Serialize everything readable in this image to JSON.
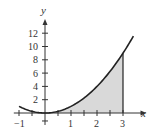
{
  "chart_data": {
    "type": "line",
    "title": "",
    "function": "y = x^2",
    "xlabel": "x",
    "ylabel": "y",
    "xlim": [
      -1.2,
      3.8
    ],
    "ylim": [
      -2,
      14
    ],
    "x_ticks": [
      -1,
      1,
      2,
      3
    ],
    "x_minor_ticks": [
      -0.5,
      0.5,
      1.5,
      2.5
    ],
    "y_ticks": [
      2,
      4,
      6,
      8,
      10,
      12
    ],
    "x": [
      -1,
      -0.5,
      0,
      0.5,
      1,
      1.5,
      2,
      2.5,
      3,
      3.4
    ],
    "values": [
      1,
      0.25,
      0,
      0.25,
      1,
      2.25,
      4,
      6.25,
      9,
      11.56
    ],
    "shaded_region": {
      "from": 0,
      "to": 3,
      "description": "area under curve y=x^2 between x=0 and x=3"
    },
    "grid": false,
    "colors": {
      "curve": "#222222",
      "shade": "#d9d9d9",
      "axis": "#333333"
    }
  },
  "labels": {
    "x_axis": "x",
    "y_axis": "y",
    "x_ticks": [
      "−1",
      "1",
      "2",
      "3"
    ],
    "y_ticks": [
      "2",
      "4",
      "6",
      "8",
      "10",
      "12"
    ]
  }
}
